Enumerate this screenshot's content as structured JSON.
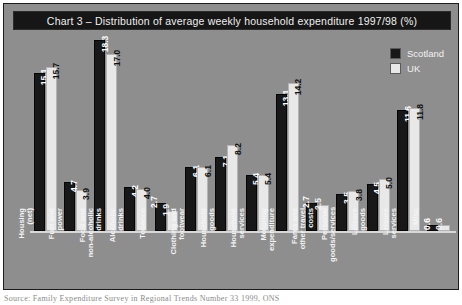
{
  "chart_data": {
    "type": "bar",
    "title": "Chart 3 – Distribution of average weekly household expenditure 1997/98 (%)",
    "xlabel": "",
    "ylabel": "",
    "ylim": [
      0,
      18.3
    ],
    "grid": false,
    "legend_position": "top-right",
    "categories": [
      "Housing (net)",
      "Fuel and power",
      "Food and non-alcoholic drinks",
      "Alcoholic drinks",
      "Tobacco",
      "Clothing and footwear",
      "Household goods",
      "Household services",
      "Motoring expenditure",
      "Fares and other travel costs",
      "Personal goods/services",
      "Leisure goods",
      "Leisure services",
      "Misc"
    ],
    "category_lines": [
      [
        "Housing",
        "(net)"
      ],
      [
        "Fuel and",
        "power"
      ],
      [
        "Food and",
        "non-alcoholic",
        "drinks"
      ],
      [
        "Alcoholic",
        "drinks"
      ],
      [
        "Tobacco"
      ],
      [
        "Clothing and",
        "footwear"
      ],
      [
        "Household",
        "goods"
      ],
      [
        "Household",
        "services"
      ],
      [
        "Motoring",
        "expenditure"
      ],
      [
        "Fares and",
        "other travel",
        "costs"
      ],
      [
        "Personal",
        "goods/services"
      ],
      [
        "Leisure",
        "goods"
      ],
      [
        "Leisure",
        "services"
      ],
      [
        "Misc"
      ]
    ],
    "series": [
      {
        "name": "Scotland",
        "color": "#181818",
        "values": [
          15.1,
          4.7,
          18.3,
          4.2,
          2.7,
          6.1,
          7.1,
          5.4,
          13.1,
          2.7,
          3.5,
          4.5,
          11.6,
          0.6
        ]
      },
      {
        "name": "UK",
        "color": "#e8e8e8",
        "values": [
          15.7,
          3.9,
          17.0,
          4.0,
          1.9,
          6.1,
          8.2,
          5.4,
          14.2,
          2.5,
          3.8,
          5.0,
          11.8,
          0.6
        ]
      }
    ]
  },
  "legend": {
    "items": [
      {
        "label": "Scotland",
        "color": "#181818"
      },
      {
        "label": "UK",
        "color": "#e8e8e8"
      }
    ]
  },
  "source_note": "Source: Family Expenditure Survey in Regional Trends Number 33 1999, ONS"
}
